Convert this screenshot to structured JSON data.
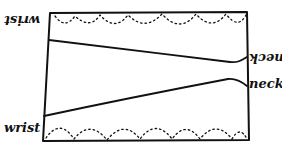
{
  "diagram": {
    "type": "hand-drawn pattern sketch",
    "labels": {
      "top_left": "wrist",
      "top_right": "neck",
      "bottom_left": "wrist",
      "bottom_right": "neck"
    },
    "label_orientation": {
      "top_left": "upside-down",
      "top_right": "upside-down",
      "bottom_left": "upright",
      "bottom_right": "upright"
    },
    "colors": {
      "ink": "#111111",
      "background": "#ffffff"
    }
  }
}
